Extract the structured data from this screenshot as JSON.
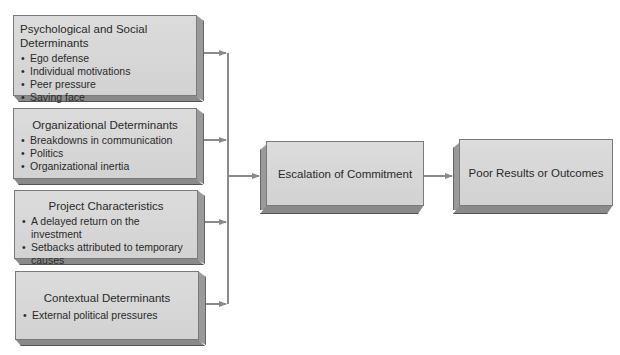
{
  "diagram": {
    "determinants": [
      {
        "title": "Psychological and Social Determinants",
        "items": [
          "Ego defense",
          "Individual motivations",
          "Peer pressure",
          "Saving face"
        ]
      },
      {
        "title": "Organizational Determinants",
        "items": [
          "Breakdowns in communication",
          "Politics",
          "Organizational inertia"
        ]
      },
      {
        "title": "Project Characteristics",
        "items": [
          "A delayed return on the investment",
          "Setbacks attributed to temporary causes"
        ]
      },
      {
        "title": "Contextual Determinants",
        "items": [
          "External political pressures"
        ]
      }
    ],
    "center": {
      "label": "Escalation of Commitment"
    },
    "outcome": {
      "label": "Poor Results or Outcomes"
    },
    "colors": {
      "box_face": "#d8d8d8",
      "box_side": "#9a9a9a",
      "arrow": "#8a8a8a",
      "text": "#2a2a2a"
    }
  }
}
